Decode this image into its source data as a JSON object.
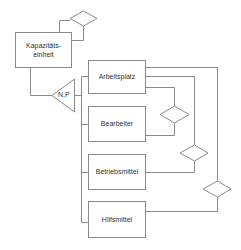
{
  "diagram": {
    "type": "entity-relationship",
    "colors": {
      "line": "#8a8a8a",
      "text": "#333333",
      "background": "#ffffff"
    },
    "entities": [
      {
        "id": "kapazitaetseinheit",
        "label": "Kapazitäts-\neinheit"
      },
      {
        "id": "arbeitsplatz",
        "label": "Arbeitsplatz"
      },
      {
        "id": "bearbeiter",
        "label": "Bearbeiter"
      },
      {
        "id": "betriebsmittel",
        "label": "Betriebsmittel"
      },
      {
        "id": "hilfsmittel",
        "label": "Hilfsmittel"
      }
    ],
    "generalization": {
      "label": "N,P",
      "parent": "kapazitaetseinheit",
      "children": [
        "arbeitsplatz",
        "bearbeiter",
        "betriebsmittel",
        "hilfsmittel"
      ]
    },
    "relationships": [
      {
        "id": "rel-kapazitaetseinheit-self",
        "from": "kapazitaetseinheit",
        "to": "kapazitaetseinheit"
      },
      {
        "id": "rel-arbeitsplatz-bearbeiter",
        "from": "arbeitsplatz",
        "to": "bearbeiter"
      },
      {
        "id": "rel-arbeitsplatz-betriebsmittel",
        "from": "arbeitsplatz",
        "to": "betriebsmittel"
      },
      {
        "id": "rel-arbeitsplatz-hilfsmittel",
        "from": "arbeitsplatz",
        "to": "hilfsmittel"
      }
    ]
  }
}
